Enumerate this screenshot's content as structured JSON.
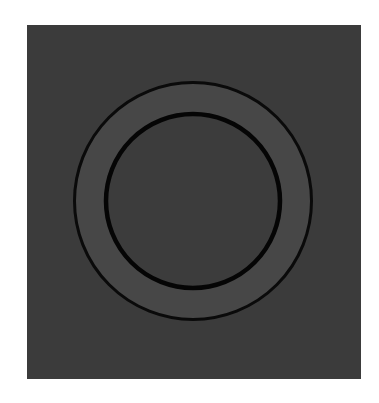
{
  "figure": {
    "page_background": "#ffffff",
    "panel": {
      "x": 27,
      "y": 25,
      "width": 334,
      "height": 354,
      "fill": "#3b3b3b"
    },
    "ring": {
      "center": {
        "x": 193,
        "y": 201
      },
      "outer_radius": 118.5,
      "inner_radius": 87,
      "band_fill": "#474747",
      "inner_fill": "#3c3c3c",
      "outer_stroke": {
        "color": "#0a0a0a",
        "width": 3
      },
      "inner_stroke": {
        "color": "#050505",
        "width": 4.5
      }
    }
  }
}
